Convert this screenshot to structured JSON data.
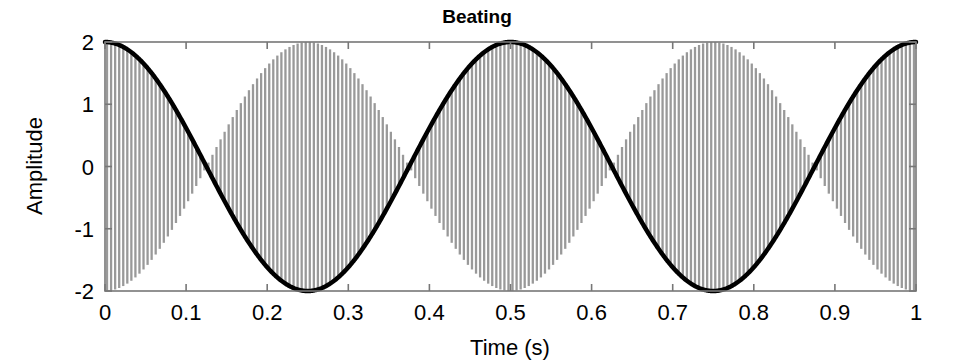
{
  "chart_data": {
    "type": "line",
    "title": "Beating",
    "xlabel": "Time (s)",
    "ylabel": "Amplitude",
    "xlim": [
      0,
      1
    ],
    "ylim": [
      -2,
      2
    ],
    "grid": false,
    "legend": "none",
    "xticks": [
      0,
      0.1,
      0.2,
      0.3,
      0.4,
      0.5,
      0.6,
      0.7,
      0.8,
      0.9,
      1
    ],
    "xtick_labels": [
      "0",
      "0.1",
      "0.2",
      "0.3",
      "0.4",
      "0.5",
      "0.6",
      "0.7",
      "0.8",
      "0.9",
      "1"
    ],
    "yticks": [
      2,
      1,
      0,
      -1,
      -2
    ],
    "ytick_labels": [
      "2",
      "1",
      "0",
      "-1",
      "-2"
    ],
    "series": [
      {
        "name": "carrier",
        "description": "Beating signal: 2*cos(2*pi*2*t)*cos(2*pi*200*t)",
        "color": "#999999",
        "linewidth": 1,
        "carrier_frequency_hz": 200,
        "modulation_frequency_hz": 2,
        "peak_amplitude": 2,
        "samples_per_second": 4000
      },
      {
        "name": "envelope",
        "description": "Envelope: 2*cos(2*pi*2*t)",
        "color": "#000000",
        "linewidth": 4,
        "frequency_hz": 2,
        "peak_amplitude": 2,
        "nodes_at_t": [
          0.125,
          0.375,
          0.625,
          0.875
        ],
        "maxima_at_t": [
          0,
          0.5,
          1
        ],
        "minima_at_t": [
          0.25,
          0.75
        ]
      }
    ],
    "beat_frequency_hz": 4,
    "component_frequencies_hz": [
      198,
      202
    ]
  },
  "axes": {
    "box_color": "#777777",
    "tick_direction": "in"
  }
}
